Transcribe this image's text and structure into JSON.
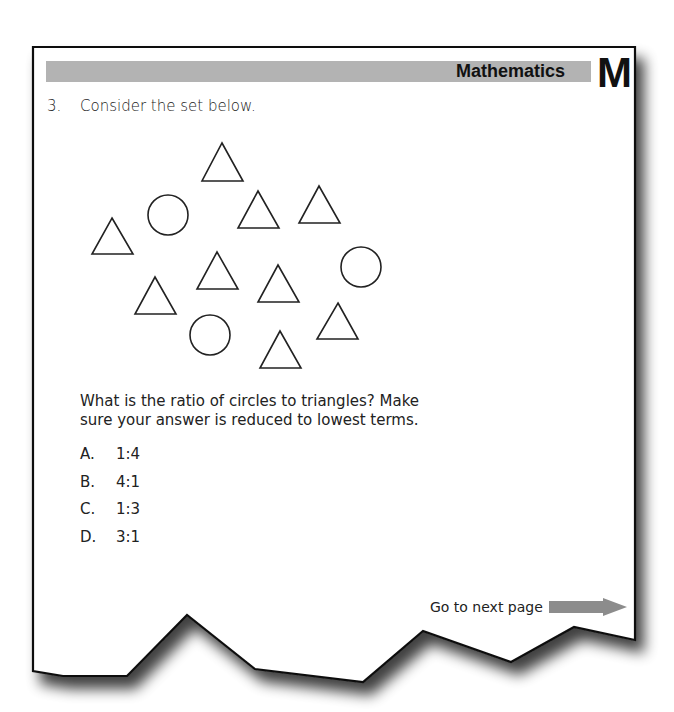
{
  "header": {
    "subject": "Mathematics",
    "subject_letter": "M",
    "bar_color": "#b3b3b3"
  },
  "question": {
    "number": "3.",
    "intro": "Consider the set below.",
    "prompt": "What is the ratio of circles to triangles? Make sure your answer is reduced to lowest terms.",
    "figure": {
      "description": "Set of shapes: 3 circles and 9 triangles",
      "circle_count": 3,
      "triangle_count": 9,
      "shapes": [
        {
          "type": "triangle",
          "apex": [
            222,
            143
          ],
          "base_y": 181,
          "base_x": [
            202,
            243
          ]
        },
        {
          "type": "circle",
          "center": [
            168,
            215
          ],
          "r": 20
        },
        {
          "type": "triangle",
          "apex": [
            258,
            191
          ],
          "base_y": 228,
          "base_x": [
            238,
            279
          ]
        },
        {
          "type": "triangle",
          "apex": [
            319,
            186
          ],
          "base_y": 223,
          "base_x": [
            299,
            340
          ]
        },
        {
          "type": "triangle",
          "apex": [
            112,
            218
          ],
          "base_y": 254,
          "base_x": [
            92,
            133
          ]
        },
        {
          "type": "triangle",
          "apex": [
            217,
            252
          ],
          "base_y": 289,
          "base_x": [
            197,
            238
          ]
        },
        {
          "type": "triangle",
          "apex": [
            278,
            265
          ],
          "base_y": 302,
          "base_x": [
            258,
            299
          ]
        },
        {
          "type": "circle",
          "center": [
            361,
            267
          ],
          "r": 20
        },
        {
          "type": "triangle",
          "apex": [
            155,
            277
          ],
          "base_y": 314,
          "base_x": [
            135,
            176
          ]
        },
        {
          "type": "triangle",
          "apex": [
            338,
            303
          ],
          "base_y": 339,
          "base_x": [
            317,
            358
          ]
        },
        {
          "type": "circle",
          "center": [
            210,
            335
          ],
          "r": 20
        },
        {
          "type": "triangle",
          "apex": [
            280,
            331
          ],
          "base_y": 368,
          "base_x": [
            260,
            301
          ]
        }
      ]
    },
    "options": [
      {
        "letter": "A.",
        "value": "1:4"
      },
      {
        "letter": "B.",
        "value": "4:1"
      },
      {
        "letter": "C.",
        "value": "1:3"
      },
      {
        "letter": "D.",
        "value": "3:1"
      }
    ]
  },
  "footer": {
    "next_label": "Go to next page",
    "arrow_color": "#8c8c8c"
  }
}
